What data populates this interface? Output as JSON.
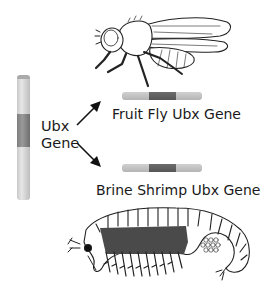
{
  "diagram": {
    "source_gene": {
      "label_line1": "Ubx",
      "label_line2": "Gene",
      "orientation": "vertical"
    },
    "targets": [
      {
        "label": "Fruit Fly Ubx Gene",
        "organism_icon": "fruit-fly-illustration"
      },
      {
        "label": "Brine Shrimp Ubx Gene",
        "organism_icon": "brine-shrimp-illustration"
      }
    ],
    "arrows": [
      {
        "from": "Ubx Gene",
        "to": "Fruit Fly Ubx Gene",
        "direction": "up-right"
      },
      {
        "from": "Ubx Gene",
        "to": "Brine Shrimp Ubx Gene",
        "direction": "down-right"
      }
    ],
    "colors": {
      "gene_light": "#c4c4c4",
      "gene_dark": "#6a6a6a",
      "line": "#1a1a1a",
      "background": "#ffffff"
    }
  }
}
